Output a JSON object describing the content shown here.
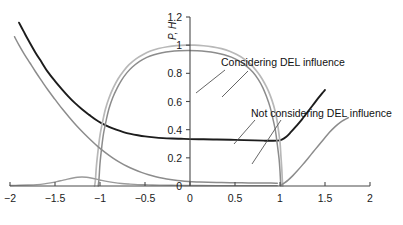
{
  "chart_data": {
    "type": "line",
    "title": "",
    "xlabel": "",
    "ylabel": "P, H",
    "xlim": [
      -2,
      2
    ],
    "ylim": [
      0,
      1.2
    ],
    "grid": false,
    "legend_position": "inline-annotations",
    "xticks": [
      "−2",
      "−1.5",
      "−1",
      "−0.5",
      "0",
      "0.5",
      "1",
      "1.5",
      "2"
    ],
    "xtick_values": [
      -2,
      -1.5,
      -1,
      -0.5,
      0,
      0.5,
      1,
      1.5,
      2
    ],
    "yticks": [
      "0",
      "0.2",
      "0.4",
      "0.6",
      "0.8",
      "1",
      "1.2"
    ],
    "ytick_values": [
      0,
      0.2,
      0.4,
      0.6,
      0.8,
      1,
      1.2
    ],
    "annotations": [
      {
        "text": "Considering DEL influence",
        "x": 0.62,
        "y": 0.8
      },
      {
        "text": "Not considering DEL influence",
        "x": 0.78,
        "y": 0.44
      }
    ],
    "series": [
      {
        "name": "P considering DEL influence",
        "color": "#1c1c1c",
        "width": 1.9,
        "points": [
          [
            -1.9,
            1.16
          ],
          [
            -1.85,
            1.1
          ],
          [
            -1.8,
            1.04
          ],
          [
            -1.72,
            0.95
          ],
          [
            -1.65,
            0.88
          ],
          [
            -1.58,
            0.81
          ],
          [
            -1.5,
            0.745
          ],
          [
            -1.42,
            0.685
          ],
          [
            -1.35,
            0.635
          ],
          [
            -1.28,
            0.59
          ],
          [
            -1.2,
            0.545
          ],
          [
            -1.12,
            0.505
          ],
          [
            -1.05,
            0.472
          ],
          [
            -0.98,
            0.445
          ],
          [
            -0.9,
            0.42
          ],
          [
            -0.82,
            0.4
          ],
          [
            -0.74,
            0.383
          ],
          [
            -0.66,
            0.37
          ],
          [
            -0.58,
            0.36
          ],
          [
            -0.5,
            0.352
          ],
          [
            -0.4,
            0.345
          ],
          [
            -0.3,
            0.34
          ],
          [
            -0.2,
            0.337
          ],
          [
            -0.1,
            0.335
          ],
          [
            0.0,
            0.333
          ],
          [
            0.15,
            0.332
          ],
          [
            0.3,
            0.33
          ],
          [
            0.45,
            0.328
          ],
          [
            0.6,
            0.326
          ],
          [
            0.72,
            0.324
          ],
          [
            0.82,
            0.322
          ],
          [
            0.9,
            0.321
          ],
          [
            0.97,
            0.322
          ],
          [
            1.02,
            0.33
          ],
          [
            1.07,
            0.35
          ],
          [
            1.12,
            0.382
          ],
          [
            1.18,
            0.425
          ],
          [
            1.24,
            0.47
          ],
          [
            1.3,
            0.52
          ],
          [
            1.36,
            0.57
          ],
          [
            1.42,
            0.62
          ],
          [
            1.47,
            0.66
          ],
          [
            1.5,
            0.682
          ]
        ]
      },
      {
        "name": "H bell curve outer (light)",
        "color": "#b8b8b8",
        "width": 1.7,
        "points": [
          [
            -1.06,
            0.0
          ],
          [
            -1.05,
            0.05
          ],
          [
            -1.04,
            0.14
          ],
          [
            -1.02,
            0.26
          ],
          [
            -1.0,
            0.36
          ],
          [
            -0.97,
            0.46
          ],
          [
            -0.94,
            0.545
          ],
          [
            -0.9,
            0.625
          ],
          [
            -0.85,
            0.7
          ],
          [
            -0.8,
            0.76
          ],
          [
            -0.74,
            0.815
          ],
          [
            -0.68,
            0.86
          ],
          [
            -0.6,
            0.903
          ],
          [
            -0.52,
            0.934
          ],
          [
            -0.44,
            0.958
          ],
          [
            -0.35,
            0.976
          ],
          [
            -0.25,
            0.989
          ],
          [
            -0.15,
            0.997
          ],
          [
            -0.05,
            1.0
          ],
          [
            0.05,
            1.0
          ],
          [
            0.15,
            0.996
          ],
          [
            0.25,
            0.988
          ],
          [
            0.35,
            0.975
          ],
          [
            0.44,
            0.957
          ],
          [
            0.52,
            0.933
          ],
          [
            0.6,
            0.902
          ],
          [
            0.68,
            0.86
          ],
          [
            0.74,
            0.816
          ],
          [
            0.8,
            0.762
          ],
          [
            0.85,
            0.703
          ],
          [
            0.89,
            0.645
          ],
          [
            0.93,
            0.57
          ],
          [
            0.96,
            0.49
          ],
          [
            0.98,
            0.41
          ],
          [
            1.0,
            0.31
          ],
          [
            1.01,
            0.215
          ],
          [
            1.02,
            0.12
          ],
          [
            1.025,
            0.05
          ],
          [
            1.03,
            0.0
          ]
        ]
      },
      {
        "name": "H bell curve inner (gray)",
        "color": "#8c8c8c",
        "width": 1.5,
        "points": [
          [
            -1.02,
            0.0
          ],
          [
            -1.01,
            0.06
          ],
          [
            -1.0,
            0.16
          ],
          [
            -0.98,
            0.28
          ],
          [
            -0.96,
            0.375
          ],
          [
            -0.93,
            0.47
          ],
          [
            -0.9,
            0.55
          ],
          [
            -0.86,
            0.625
          ],
          [
            -0.81,
            0.695
          ],
          [
            -0.76,
            0.752
          ],
          [
            -0.7,
            0.805
          ],
          [
            -0.64,
            0.845
          ],
          [
            -0.56,
            0.885
          ],
          [
            -0.48,
            0.913
          ],
          [
            -0.4,
            0.932
          ],
          [
            -0.31,
            0.946
          ],
          [
            -0.22,
            0.955
          ],
          [
            -0.12,
            0.96
          ],
          [
            -0.02,
            0.962
          ],
          [
            0.08,
            0.96
          ],
          [
            0.18,
            0.955
          ],
          [
            0.28,
            0.946
          ],
          [
            0.38,
            0.932
          ],
          [
            0.46,
            0.915
          ],
          [
            0.54,
            0.89
          ],
          [
            0.62,
            0.855
          ],
          [
            0.7,
            0.808
          ],
          [
            0.76,
            0.755
          ],
          [
            0.81,
            0.697
          ],
          [
            0.85,
            0.635
          ],
          [
            0.89,
            0.56
          ],
          [
            0.92,
            0.48
          ],
          [
            0.95,
            0.39
          ],
          [
            0.97,
            0.295
          ],
          [
            0.99,
            0.19
          ],
          [
            1.0,
            0.105
          ],
          [
            1.005,
            0.045
          ],
          [
            1.01,
            0.0
          ]
        ]
      },
      {
        "name": "gray decaying curve left",
        "color": "#8c8c8c",
        "width": 1.5,
        "points": [
          [
            -1.95,
            1.06
          ],
          [
            -1.9,
            1.0
          ],
          [
            -1.84,
            0.935
          ],
          [
            -1.78,
            0.875
          ],
          [
            -1.72,
            0.815
          ],
          [
            -1.65,
            0.748
          ],
          [
            -1.58,
            0.683
          ],
          [
            -1.5,
            0.615
          ],
          [
            -1.42,
            0.548
          ],
          [
            -1.34,
            0.487
          ],
          [
            -1.26,
            0.428
          ],
          [
            -1.18,
            0.375
          ],
          [
            -1.1,
            0.325
          ],
          [
            -1.02,
            0.278
          ],
          [
            -0.94,
            0.237
          ],
          [
            -0.86,
            0.2
          ],
          [
            -0.78,
            0.168
          ],
          [
            -0.7,
            0.14
          ],
          [
            -0.62,
            0.117
          ],
          [
            -0.54,
            0.097
          ],
          [
            -0.46,
            0.08
          ],
          [
            -0.38,
            0.066
          ],
          [
            -0.3,
            0.055
          ],
          [
            -0.22,
            0.046
          ],
          [
            -0.14,
            0.039
          ],
          [
            -0.06,
            0.034
          ],
          [
            0.02,
            0.03
          ],
          [
            0.1,
            0.028
          ],
          [
            0.2,
            0.026
          ],
          [
            0.35,
            0.024
          ],
          [
            0.5,
            0.023
          ],
          [
            0.65,
            0.022
          ],
          [
            0.8,
            0.021
          ],
          [
            0.9,
            0.021
          ],
          [
            0.97,
            0.02
          ]
        ]
      },
      {
        "name": "gray bump left",
        "color": "#9a9a9a",
        "width": 1.4,
        "points": [
          [
            -2.0,
            0.004
          ],
          [
            -1.9,
            0.005
          ],
          [
            -1.8,
            0.007
          ],
          [
            -1.7,
            0.01
          ],
          [
            -1.62,
            0.015
          ],
          [
            -1.55,
            0.022
          ],
          [
            -1.48,
            0.031
          ],
          [
            -1.42,
            0.04
          ],
          [
            -1.36,
            0.049
          ],
          [
            -1.3,
            0.057
          ],
          [
            -1.25,
            0.062
          ],
          [
            -1.2,
            0.064
          ],
          [
            -1.15,
            0.062
          ],
          [
            -1.1,
            0.057
          ],
          [
            -1.04,
            0.049
          ],
          [
            -0.98,
            0.04
          ],
          [
            -0.91,
            0.031
          ],
          [
            -0.84,
            0.024
          ],
          [
            -0.76,
            0.018
          ],
          [
            -0.68,
            0.014
          ],
          [
            -0.58,
            0.01
          ],
          [
            -0.46,
            0.008
          ],
          [
            -0.34,
            0.006
          ],
          [
            -0.2,
            0.005
          ],
          [
            -0.05,
            0.004
          ],
          [
            0.1,
            0.004
          ],
          [
            0.3,
            0.003
          ],
          [
            0.55,
            0.003
          ],
          [
            0.8,
            0.003
          ],
          [
            0.97,
            0.003
          ]
        ]
      },
      {
        "name": "gray rising curve right",
        "color": "#8c8c8c",
        "width": 1.5,
        "points": [
          [
            1.02,
            0.01
          ],
          [
            1.05,
            0.022
          ],
          [
            1.09,
            0.042
          ],
          [
            1.14,
            0.072
          ],
          [
            1.19,
            0.106
          ],
          [
            1.25,
            0.15
          ],
          [
            1.31,
            0.196
          ],
          [
            1.37,
            0.243
          ],
          [
            1.43,
            0.29
          ],
          [
            1.49,
            0.336
          ],
          [
            1.55,
            0.381
          ],
          [
            1.61,
            0.42
          ],
          [
            1.67,
            0.452
          ],
          [
            1.72,
            0.472
          ],
          [
            1.76,
            0.485
          ]
        ]
      }
    ]
  },
  "axis": {
    "y_label": "P, H"
  }
}
